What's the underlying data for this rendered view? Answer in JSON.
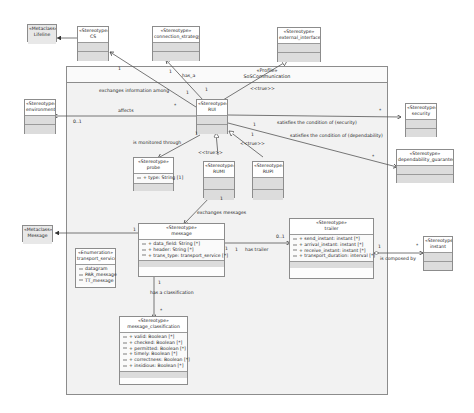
{
  "profile": {
    "stereotype": "«Profile»",
    "name": "SoSCommunication"
  },
  "classes": {
    "lifeline": {
      "stereotype": "«Metaclass»",
      "name": "Lifeline"
    },
    "cs": {
      "stereotype": "«Stereotype»",
      "name": "CS"
    },
    "connection": {
      "stereotype": "«Stereotype»",
      "name": "connection_strategy"
    },
    "external": {
      "stereotype": "«Stereotype»",
      "name": "external_interface"
    },
    "environment": {
      "stereotype": "«Stereotype»",
      "name": "environment"
    },
    "rui": {
      "stereotype": "«Stereotype»",
      "name": "RUI"
    },
    "security": {
      "stereotype": "«Stereotype»",
      "name": "security"
    },
    "dependability": {
      "stereotype": "«Stereotype»",
      "name": "dependability_guarantee"
    },
    "probe": {
      "stereotype": "«Stereotype»",
      "name": "probe",
      "attrs": [
        "+ type: String [1]"
      ]
    },
    "rumi": {
      "stereotype": "«Stereotype»",
      "name": "RUMI"
    },
    "rupi": {
      "stereotype": "«Stereotype»",
      "name": "RUPI"
    },
    "message_meta": {
      "stereotype": "«Metaclass»",
      "name": "Message"
    },
    "message": {
      "stereotype": "«Stereotype»",
      "name": "message",
      "attrs": [
        "+ data_field: String [*]",
        "+ header: String [*]",
        "+ trans_type: transport_service [*]"
      ]
    },
    "transport": {
      "stereotype": "«Enumeration»",
      "name": "transport_service",
      "attrs": [
        "datagram",
        "PAR_message",
        "TT_message"
      ]
    },
    "trailer": {
      "stereotype": "«Stereotype»",
      "name": "trailer",
      "attrs": [
        "+ send_instant: instant [*]",
        "+ arrival_instant: instant [*]",
        "+ receive_instant: instant [*]",
        "+ transport_duration: interval [*]"
      ]
    },
    "instant": {
      "stereotype": "«Stereotype»",
      "name": "instant"
    },
    "classification": {
      "stereotype": "«Stereotype»",
      "name": "message_classification",
      "attrs": [
        "+ valid: Boolean [*]",
        "+ checked: Boolean [*]",
        "+ permitted: Boolean [*]",
        "+ timely: Boolean [*]",
        "+ correctness: Boolean [*]",
        "+ insidious: Boolean [*]"
      ]
    }
  },
  "labels": {
    "has_a": "has_a",
    "exchanges_info": "exchanges information among",
    "affects": "affects",
    "mult_01_env": "0..1",
    "true1": "<<true>>",
    "true2": "<<true>>",
    "true3": "<<true>>",
    "sat_security": "satisfies the condition of (security)",
    "sat_dependability": "satisfies the condition of (dependability)",
    "monitored": "is monitored through",
    "exchanges_messages": "exchanges messages",
    "has_trailer": "has trailer",
    "has_classification": "has a classification",
    "composed": "is composed by",
    "one_a": "1",
    "one_b": "1",
    "one_c": "1",
    "one_d": "1",
    "one_e": "1",
    "one_f": "1",
    "one_g": "1",
    "one_h": "1",
    "one_i": "1",
    "one_j": "1",
    "one_k": "1",
    "one_l": "1",
    "one_m": "1",
    "star_a": "*",
    "star_b": "*",
    "star_c": "*",
    "star_d": "*",
    "star_e": "*",
    "mult_01_trailer": "0..1"
  }
}
